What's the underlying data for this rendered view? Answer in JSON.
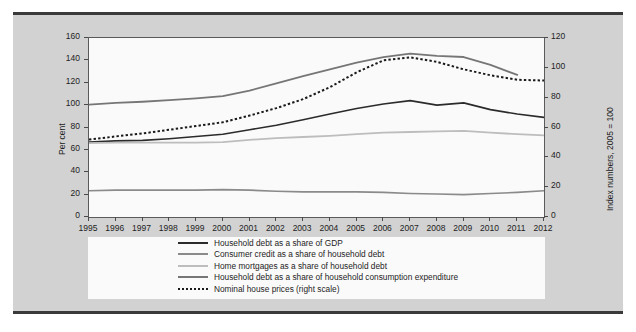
{
  "chart_data": {
    "type": "line",
    "title": "",
    "xlabel": "",
    "ylabel": "Per cent",
    "y2label": "Index numbers, 2005 = 100",
    "grid": false,
    "legend_position": "bottom",
    "x": [
      1995,
      1996,
      1997,
      1998,
      1999,
      2000,
      2001,
      2002,
      2003,
      2004,
      2005,
      2006,
      2007,
      2008,
      2009,
      2010,
      2011,
      2012
    ],
    "xlim": [
      1995,
      2012
    ],
    "ylim": [
      0,
      160
    ],
    "y2lim": [
      0,
      120
    ],
    "yticks": [
      0,
      20,
      40,
      60,
      80,
      100,
      120,
      140,
      160
    ],
    "y2ticks": [
      0,
      20,
      40,
      60,
      80,
      100,
      120
    ],
    "xticks": [
      "1995",
      "1996",
      "1997",
      "1998",
      "1999",
      "2000",
      "2001",
      "2002",
      "2003",
      "2004",
      "2005",
      "2006",
      "2007",
      "2008",
      "2009",
      "2010",
      "2011",
      "2012"
    ],
    "series": [
      {
        "name": "Household debt as a share of GDP",
        "axis": "left",
        "style": "solid",
        "color": "#2b2b2b",
        "width": 1.6,
        "values": [
          67,
          68,
          68.5,
          70,
          72,
          74,
          78,
          82,
          87,
          92,
          97,
          101,
          104,
          100,
          102,
          96,
          92,
          89
        ]
      },
      {
        "name": "Consumer credit as a share of household debt",
        "axis": "left",
        "style": "solid",
        "color": "#8a8a8a",
        "width": 1.6,
        "values": [
          23.5,
          24,
          24,
          24,
          24,
          24.5,
          24,
          23,
          22.5,
          22.5,
          22.5,
          22,
          21,
          20.5,
          20,
          21,
          22,
          23.5
        ]
      },
      {
        "name": "Home mortgages as a share of household debt",
        "axis": "left",
        "style": "solid",
        "color": "#bdbdbd",
        "width": 1.8,
        "values": [
          66,
          66.5,
          66.5,
          66.5,
          66.5,
          67,
          69,
          70.5,
          71.5,
          72.5,
          74,
          75.5,
          76,
          76.5,
          77,
          75.5,
          74,
          73
        ]
      },
      {
        "name": "Household debt as a share of household consumption expenditure",
        "axis": "left",
        "style": "solid",
        "color": "#767676",
        "width": 1.8,
        "values": [
          100.5,
          102,
          103,
          104.5,
          106,
          108,
          113,
          119.5,
          126,
          132,
          138,
          143,
          146,
          144,
          143,
          136,
          127,
          null
        ]
      },
      {
        "name": "Nominal house prices (right scale)",
        "axis": "right",
        "style": "dotted",
        "color": "#1a1a1a",
        "width": 2,
        "values": [
          52,
          54,
          56,
          58.5,
          61,
          63.5,
          68,
          73,
          79,
          87,
          97,
          105,
          107,
          104,
          99,
          95,
          92,
          91.5
        ]
      }
    ]
  },
  "legend": {
    "items": [
      {
        "label": "Household debt as a share of GDP",
        "swatch": "solid-dark"
      },
      {
        "label": "Consumer credit as a share of household debt",
        "swatch": "solid-mid"
      },
      {
        "label": "Home mortgages as a share of household debt",
        "swatch": "solid-light"
      },
      {
        "label": "Household debt as a share of household consumption expenditure",
        "swatch": "solid-grey"
      },
      {
        "label": "Nominal house prices (right scale)",
        "swatch": "dotted-dark"
      }
    ]
  },
  "colors": {
    "panel_background": "#fafafa",
    "figure_background": "#d2d2d2",
    "frame": "#3a3a3a",
    "axis": "#5a5a5a",
    "text": "#1d1d1d"
  }
}
